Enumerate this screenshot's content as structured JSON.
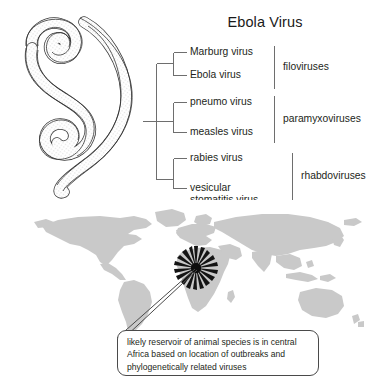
{
  "figure": {
    "title": "Ebola Virus",
    "background_color": "#ffffff",
    "ink_color": "#231f20"
  },
  "illustration": {
    "name": "ebola-virion-drawing",
    "description": "filamentous coiled ebola virion line drawing",
    "stroke_color": "#333333",
    "fill_color": "#ffffff"
  },
  "tree": {
    "type": "cladogram",
    "line_color": "#6b6b6b",
    "taxa": [
      {
        "label": "Marburg virus",
        "group": "filoviruses"
      },
      {
        "label": "Ebola virus",
        "group": "filoviruses"
      },
      {
        "label": "pneumo virus",
        "group": "paramyxoviruses"
      },
      {
        "label": "measles virus",
        "group": "paramyxoviruses"
      },
      {
        "label": "rabies virus",
        "group": "rhabdoviruses"
      },
      {
        "label": "vesicular stomatitis virus",
        "group": "rhabdoviruses"
      }
    ],
    "groups": [
      {
        "label": "filoviruses",
        "members": [
          "Marburg virus",
          "Ebola virus"
        ]
      },
      {
        "label": "paramyxoviruses",
        "members": [
          "pneumo virus",
          "measles virus"
        ]
      },
      {
        "label": "rhabdoviruses",
        "members": [
          "rabies virus",
          "vesicular stomatitis virus"
        ]
      }
    ]
  },
  "map": {
    "name": "world-map",
    "land_color": "#c9c9c9",
    "ocean_color": "#ffffff",
    "marker": {
      "name": "outbreak-starburst-marker",
      "color": "#111111",
      "location_label": "central Africa"
    }
  },
  "callout": {
    "text": "likely reservoir of animal species is in central Africa based on location of outbreaks and phylogenetically related viruses",
    "border_color": "#4a4a4a",
    "background_color": "#ffffff"
  }
}
